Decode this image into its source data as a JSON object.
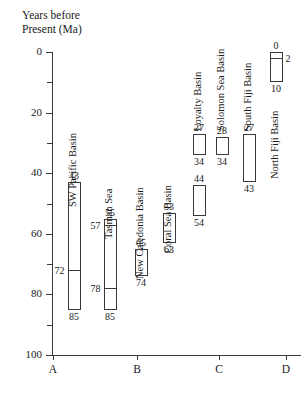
{
  "chart_data": {
    "type": "bar",
    "title": "Years before\nPresent (Ma)",
    "ylabel": "Years before Present (Ma)",
    "xlabel": "",
    "ylim": [
      0,
      100
    ],
    "y_inverted": true,
    "y_ticks_major": [
      0,
      20,
      40,
      60,
      80,
      100
    ],
    "y_ticks_minor": [
      10,
      30,
      50,
      70,
      90
    ],
    "grid": false,
    "legend": "none",
    "x_groups": [
      "A",
      "B",
      "C",
      "D"
    ],
    "units": "Ma",
    "series": [
      {
        "name": "SW Pacific Basin",
        "group": "A",
        "top": 43,
        "bottom": 85,
        "dividers": [
          72
        ],
        "labels": {
          "top": "43",
          "bottom": "85",
          "dividers": [
            "72"
          ]
        }
      },
      {
        "name": "Tasman Sea",
        "group": "A",
        "top": 55,
        "bottom": 85,
        "dividers": [
          57,
          78
        ],
        "labels": {
          "top": "55",
          "bottom": "85",
          "dividers": [
            "57",
            "78"
          ]
        }
      },
      {
        "name": "New Caledonia Basin",
        "group": "B",
        "top": 65,
        "bottom": 74,
        "dividers": [],
        "labels": {
          "top": "65",
          "bottom": "74",
          "dividers": []
        }
      },
      {
        "name": "Coral Sea Basin",
        "group": "B",
        "top": 53,
        "bottom": 63,
        "dividers": [],
        "labels": {
          "top": "53",
          "bottom": "63",
          "dividers": []
        }
      },
      {
        "name": "Loyalty Basin",
        "group": "C",
        "segments": [
          {
            "top": 27,
            "bottom": 34,
            "labels": {
              "top": "27",
              "bottom": "34"
            }
          },
          {
            "top": 44,
            "bottom": 54,
            "labels": {
              "top": "44",
              "bottom": "54"
            }
          }
        ]
      },
      {
        "name": "Solomon Sea Basin",
        "group": "C",
        "top": 28,
        "bottom": 34,
        "dividers": [],
        "labels": {
          "top": "28",
          "bottom": "34",
          "dividers": []
        }
      },
      {
        "name": "South Fiji Basin",
        "group": "C",
        "top": 27,
        "bottom": 43,
        "dividers": [],
        "labels": {
          "top": "27",
          "bottom": "43",
          "dividers": []
        }
      },
      {
        "name": "North Fiji Basin",
        "group": "D",
        "top": 0,
        "bottom": 10,
        "dividers": [
          2
        ],
        "labels": {
          "top": "0",
          "bottom": "10",
          "dividers": [
            "2"
          ]
        }
      }
    ]
  },
  "axis": {
    "y_tick_labels": [
      "0",
      "20",
      "40",
      "60",
      "80",
      "100"
    ],
    "x_tick_labels": [
      "A",
      "B",
      "C",
      "D"
    ]
  },
  "colors": {
    "ink": "#1a1a1a",
    "axis": "#3a3a3a",
    "bar_fill": "#ffffff",
    "background": "#ffffff"
  }
}
